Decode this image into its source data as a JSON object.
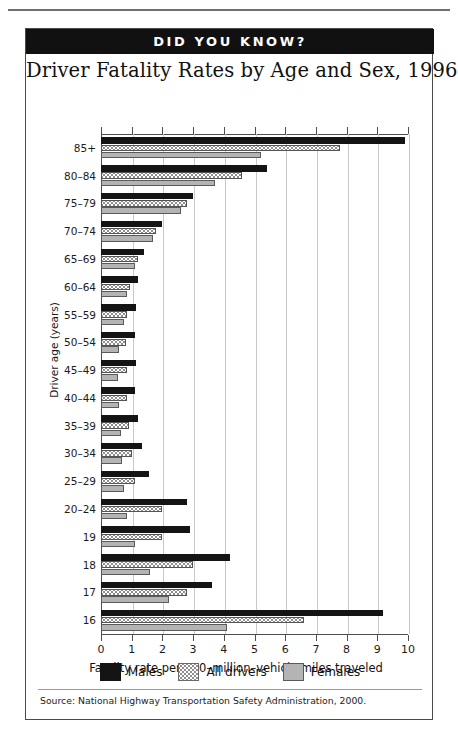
{
  "banner": {
    "title": "DID YOU KNOW?"
  },
  "chart_title": "Driver Fatality Rates by Age and Sex, 1996",
  "source": "Source:  National Highway Transportation Safety Administration, 2000.",
  "legend": [
    {
      "key": "males",
      "label": "Males",
      "color": "#141414"
    },
    {
      "key": "all",
      "label": "All drivers",
      "color": "#ffffff"
    },
    {
      "key": "females",
      "label": "Females",
      "color": "#b4b4b4"
    }
  ],
  "chart_data": {
    "type": "bar",
    "orientation": "horizontal",
    "title": "Driver Fatality Rates by Age and Sex, 1996",
    "xlabel": "Fatality rate per 100–million–vehicle miles traveled",
    "ylabel": "Driver age (years)",
    "xlim": [
      0,
      10
    ],
    "xticks": [
      0,
      1,
      2,
      3,
      4,
      5,
      6,
      7,
      8,
      9,
      10
    ],
    "xtick_labels": [
      "0",
      "1",
      "2",
      "3",
      "4",
      "5",
      "6",
      "7",
      "8",
      "9",
      "10"
    ],
    "grid": true,
    "legend_position": "bottom",
    "categories": [
      "85+",
      "80–84",
      "75–79",
      "70–74",
      "65–69",
      "60–64",
      "55–59",
      "50–54",
      "45–49",
      "40–44",
      "35–39",
      "30–34",
      "25–29",
      "20–24",
      "19",
      "18",
      "17",
      "16"
    ],
    "series": [
      {
        "name": "Males",
        "color": "#141414",
        "values": [
          9.9,
          5.4,
          3.0,
          2.0,
          1.4,
          1.2,
          1.15,
          1.1,
          1.15,
          1.1,
          1.2,
          1.35,
          1.55,
          2.8,
          2.9,
          4.2,
          3.6,
          9.2
        ]
      },
      {
        "name": "All drivers",
        "color": "#ffffff",
        "values": [
          7.8,
          4.6,
          2.8,
          1.8,
          1.2,
          0.95,
          0.85,
          0.8,
          0.85,
          0.85,
          0.9,
          1.0,
          1.1,
          2.0,
          2.0,
          3.0,
          2.8,
          6.6
        ]
      },
      {
        "name": "Females",
        "color": "#b4b4b4",
        "values": [
          5.2,
          3.7,
          2.6,
          1.7,
          1.1,
          0.85,
          0.75,
          0.6,
          0.55,
          0.6,
          0.65,
          0.7,
          0.75,
          0.85,
          1.1,
          1.6,
          2.2,
          4.1
        ]
      }
    ]
  }
}
